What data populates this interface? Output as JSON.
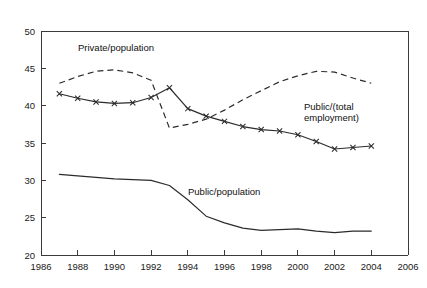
{
  "figure": {
    "top_caption_partial": "Source: authors' calculations.",
    "plot": {
      "frame_top_visible": true,
      "frame_right_visible": true
    }
  },
  "axes": {
    "x": {
      "label": "",
      "ticks": [
        "1986",
        "1988",
        "1990",
        "1992",
        "1994",
        "1996",
        "1998",
        "2000",
        "2002",
        "2004",
        "2006"
      ],
      "min": 1986,
      "max": 2006,
      "tick_step": 2
    },
    "y": {
      "label": "",
      "ticks": [
        "20",
        "25",
        "30",
        "35",
        "40",
        "45",
        "50"
      ],
      "min": 20,
      "max": 50,
      "tick_step": 5
    }
  },
  "annotations": {
    "private_population": "Private/population",
    "public_total_employment_line1": "Public/(total",
    "public_total_employment_line2": "employment)",
    "public_population": "Public/population"
  },
  "colors": {
    "ink": "#2b2b2b",
    "axis": "#3a3a3a",
    "background": "#ffffff"
  },
  "chart_data": {
    "type": "line",
    "title": "",
    "xlabel": "",
    "ylabel": "",
    "xlim": [
      1986,
      2006
    ],
    "ylim": [
      20,
      50
    ],
    "grid": false,
    "legend": "inline-annotations",
    "x": [
      1987,
      1988,
      1989,
      1990,
      1991,
      1992,
      1993,
      1994,
      1995,
      1996,
      1997,
      1998,
      1999,
      2000,
      2001,
      2002,
      2003,
      2004
    ],
    "series": [
      {
        "name": "Private/population",
        "style": "dashed",
        "marker": "none",
        "values": [
          43.0,
          43.9,
          44.6,
          44.8,
          44.4,
          43.4,
          37.0,
          37.5,
          38.2,
          39.4,
          40.8,
          42.0,
          43.2,
          44.0,
          44.6,
          44.5,
          43.7,
          43.0
        ]
      },
      {
        "name": "Public/(total employment)",
        "style": "solid",
        "marker": "x",
        "values": [
          41.6,
          41.0,
          40.5,
          40.3,
          40.4,
          41.1,
          42.4,
          39.6,
          38.6,
          37.9,
          37.2,
          36.8,
          36.6,
          36.1,
          35.2,
          34.2,
          34.4,
          34.6
        ]
      },
      {
        "name": "Public/population",
        "style": "solid",
        "marker": "none",
        "values": [
          30.8,
          30.6,
          30.4,
          30.2,
          30.1,
          30.0,
          29.3,
          27.4,
          25.2,
          24.3,
          23.6,
          23.3,
          23.4,
          23.5,
          23.2,
          23.0,
          23.2,
          23.2
        ]
      }
    ]
  }
}
